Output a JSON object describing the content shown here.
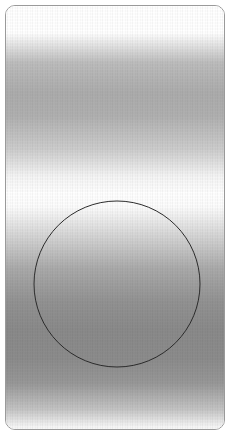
{
  "canvas": {
    "width": 232,
    "height": 439,
    "background_color": "#ffffff"
  },
  "card": {
    "name": "rounded-rectangle-frame",
    "x": 5,
    "y": 5,
    "width": 220,
    "height": 425,
    "corner_radius": 10,
    "border_color": "#9a9a9a",
    "border_width": 1,
    "fill_color": "#ffffff"
  },
  "gradients": [
    {
      "name": "upper-gradient-band",
      "orientation": "vertical",
      "top": 0,
      "height": 190,
      "peak_y": 100,
      "peak_color": "#acacac",
      "edge_color": "#ffffff"
    },
    {
      "name": "lower-gradient-band",
      "orientation": "vertical",
      "top": 186,
      "height": 239,
      "peak_y": 320,
      "peak_color": "#8a8a8a",
      "edge_color": "#ffffff"
    }
  ],
  "texture": {
    "name": "vertical-stripe-dither",
    "pattern": "repeating vertical stripes",
    "stripe_period_px": 5,
    "opacity": 0.85
  },
  "circle": {
    "name": "circle-outline",
    "center_x": 116,
    "center_y": 283,
    "radius": 83,
    "stroke_color": "#2b2b2b",
    "stroke_width": 1,
    "fill": "none"
  }
}
